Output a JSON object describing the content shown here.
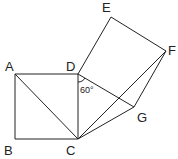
{
  "diagram": {
    "points": [
      {
        "id": "A",
        "label": "A"
      },
      {
        "id": "B",
        "label": "B"
      },
      {
        "id": "C",
        "label": "C"
      },
      {
        "id": "D",
        "label": "D"
      },
      {
        "id": "E",
        "label": "E"
      },
      {
        "id": "F",
        "label": "F"
      },
      {
        "id": "G",
        "label": "G"
      }
    ],
    "segments": [
      [
        "A",
        "B"
      ],
      [
        "B",
        "C"
      ],
      [
        "C",
        "D"
      ],
      [
        "D",
        "A"
      ],
      [
        "A",
        "C"
      ],
      [
        "D",
        "E"
      ],
      [
        "E",
        "F"
      ],
      [
        "F",
        "G"
      ],
      [
        "G",
        "D"
      ],
      [
        "C",
        "G"
      ],
      [
        "C",
        "F"
      ]
    ],
    "angle_label": "60°",
    "angle_vertex": "D"
  }
}
